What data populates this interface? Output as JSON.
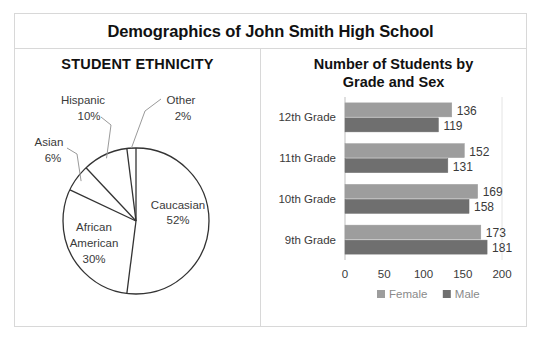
{
  "header": {
    "title": "Demographics of John Smith High School"
  },
  "pie_panel": {
    "title": "STUDENT ETHNICITY"
  },
  "bar_panel": {
    "title_line1": "Number of Students by",
    "title_line2": "Grade and Sex"
  },
  "chart_data": [
    {
      "type": "pie",
      "title": "STUDENT ETHNICITY",
      "start_angle": 0,
      "direction": "clockwise",
      "slice_fill": "#ffffff",
      "slice_stroke": "#333333",
      "labels": [
        "Caucasian",
        "African American",
        "Asian",
        "Hispanic",
        "Other"
      ],
      "values": [
        52,
        30,
        6,
        10,
        2
      ],
      "value_suffix": "%",
      "slices": [
        {
          "label": "Caucasian",
          "value": 52,
          "display_value": "52%",
          "label_lines": [
            "Caucasian",
            "52%"
          ],
          "placement": "inside"
        },
        {
          "label": "African American",
          "value": 30,
          "display_value": "30%",
          "label_lines": [
            "African",
            "American",
            "30%"
          ],
          "placement": "inside"
        },
        {
          "label": "Asian",
          "value": 6,
          "display_value": "6%",
          "label_lines": [
            "Asian",
            "6%"
          ],
          "placement": "outside"
        },
        {
          "label": "Hispanic",
          "value": 10,
          "display_value": "10%",
          "label_lines": [
            "Hispanic",
            "10%"
          ],
          "placement": "outside"
        },
        {
          "label": "Other",
          "value": 2,
          "display_value": "2%",
          "label_lines": [
            "Other",
            "2%"
          ],
          "placement": "outside"
        }
      ]
    },
    {
      "type": "bar",
      "orientation": "horizontal",
      "title": "Number of Students by Grade and Sex",
      "xlabel": "",
      "ylabel": "",
      "xlim": [
        0,
        200
      ],
      "xticks": [
        0,
        50,
        100,
        150,
        200
      ],
      "grid": false,
      "legend_position": "bottom",
      "categories": [
        "12th Grade",
        "11th Grade",
        "10th Grade",
        "9th Grade"
      ],
      "series": [
        {
          "name": "Female",
          "color": "#9d9d9d",
          "values": [
            136,
            152,
            169,
            173
          ]
        },
        {
          "name": "Male",
          "color": "#6f6f6f",
          "values": [
            119,
            131,
            158,
            181
          ]
        }
      ],
      "legend": [
        {
          "label": "Female",
          "color": "#9d9d9d"
        },
        {
          "label": "Male",
          "color": "#6f6f6f"
        }
      ]
    }
  ],
  "colors": {
    "frame_border": "#d8d8d8",
    "title_text": "#111111",
    "axis_line": "#bfbfbf",
    "female_bar": "#9d9d9d",
    "male_bar": "#6f6f6f",
    "pie_outline": "#333333"
  }
}
